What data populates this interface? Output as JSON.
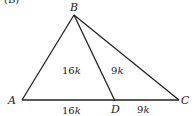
{
  "figure": {
    "part_label": "(B)",
    "vertices": {
      "A": {
        "label": "A",
        "x": 22,
        "y": 100
      },
      "B": {
        "label": "B",
        "x": 74,
        "y": 15
      },
      "C": {
        "label": "C",
        "x": 179,
        "y": 100
      },
      "D": {
        "label": "D",
        "x": 115,
        "y": 101
      }
    },
    "segments": [
      "AB",
      "BC",
      "AC",
      "BD"
    ],
    "areas": {
      "ABD": {
        "num": "16",
        "var": "k"
      },
      "DBC": {
        "num": "9",
        "var": "k"
      }
    },
    "lengths": {
      "AD": {
        "num": "16",
        "var": "k"
      },
      "DC": {
        "num": "9",
        "var": "k"
      }
    }
  }
}
